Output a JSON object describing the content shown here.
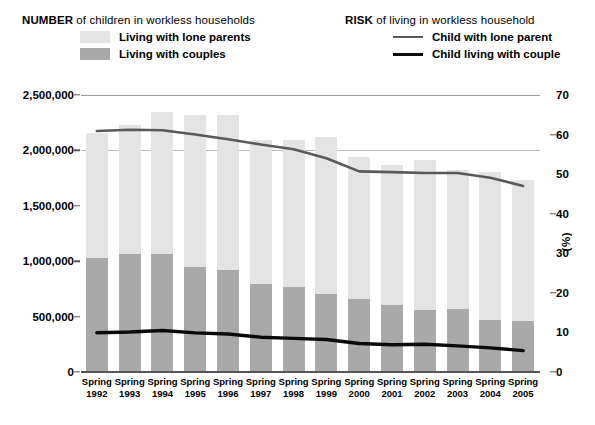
{
  "legend": {
    "number": {
      "title_strong": "NUMBER",
      "title_rest": " of children in workless households",
      "items": [
        {
          "label": "Living with lone parents",
          "color": "#e4e4e4",
          "swatch": "bar-swatch-lone-parents"
        },
        {
          "label": "Living with couples",
          "color": "#a9a9a9",
          "swatch": "bar-swatch-couples"
        }
      ]
    },
    "risk": {
      "title_strong": "RISK",
      "title_rest": " of living in workless household",
      "items": [
        {
          "label": "Child with lone parent",
          "color": "#595959",
          "width": "2.6px"
        },
        {
          "label": "Child living with couple",
          "color": "#0a0a0a",
          "width": "3.4px"
        }
      ]
    }
  },
  "axes": {
    "left": {
      "ticks": [
        "2,500,000",
        "2,000,000",
        "1,500,000",
        "1,000,000",
        "500,000",
        "0"
      ],
      "min": 0,
      "max": 2500000
    },
    "right": {
      "title": "(%)",
      "ticks": [
        "70",
        "60",
        "50",
        "40",
        "30",
        "20",
        "10",
        "0"
      ],
      "min": 0,
      "max": 70
    },
    "x": {
      "labels": [
        {
          "top": "Spring",
          "bottom": "1992"
        },
        {
          "top": "Spring",
          "bottom": "1993"
        },
        {
          "top": "Spring",
          "bottom": "1994"
        },
        {
          "top": "Spring",
          "bottom": "1995"
        },
        {
          "top": "Spring",
          "bottom": "1996"
        },
        {
          "top": "Spring",
          "bottom": "1997"
        },
        {
          "top": "Spring",
          "bottom": "1998"
        },
        {
          "top": "Spring",
          "bottom": "1999"
        },
        {
          "top": "Spring",
          "bottom": "2000"
        },
        {
          "top": "Spring",
          "bottom": "2001"
        },
        {
          "top": "Spring",
          "bottom": "2002"
        },
        {
          "top": "Spring",
          "bottom": "2003"
        },
        {
          "top": "Spring",
          "bottom": "2004"
        },
        {
          "top": "Spring",
          "bottom": "2005"
        }
      ]
    }
  },
  "chart_data": {
    "type": "bar",
    "categories": [
      "Spring 1992",
      "Spring 1993",
      "Spring 1994",
      "Spring 1995",
      "Spring 1996",
      "Spring 1997",
      "Spring 1998",
      "Spring 1999",
      "Spring 2000",
      "Spring 2001",
      "Spring 2002",
      "Spring 2003",
      "Spring 2004",
      "Spring 2005"
    ],
    "xlabel": "",
    "ylabel": "Number of children",
    "ylabel_right": "(%)",
    "ylim": [
      0,
      2500000
    ],
    "ylim_right": [
      0,
      70
    ],
    "grid": true,
    "legend_position": "top",
    "stacked": true,
    "series": [
      {
        "name": "Living with couples",
        "kind": "bar-segment",
        "axis": "left",
        "color": "#a9a9a9",
        "values": [
          1030000,
          1065000,
          1065000,
          948000,
          920000,
          790000,
          767000,
          705000,
          660000,
          605000,
          560000,
          570000,
          470000,
          460000
        ]
      },
      {
        "name": "Living with lone parents",
        "kind": "bar-segment",
        "axis": "left",
        "color": "#e4e4e4",
        "values": [
          1127000,
          1165000,
          1282000,
          1372000,
          1400000,
          1305000,
          1330000,
          1415000,
          1280000,
          1265000,
          1354000,
          1253000,
          1335000,
          1273000
        ]
      },
      {
        "name": "Total children in workless households",
        "kind": "bar-total",
        "axis": "left",
        "values": [
          2157000,
          2230000,
          2347000,
          2320000,
          2320000,
          2095000,
          2097000,
          2120000,
          1940000,
          1870000,
          1914000,
          1823000,
          1805000,
          1733000
        ]
      },
      {
        "name": "Child with lone parent",
        "kind": "line",
        "axis": "right",
        "color": "#595959",
        "values": [
          60.9,
          61.2,
          61.1,
          60.0,
          58.8,
          57.5,
          56.3,
          54.0,
          50.7,
          50.5,
          50.3,
          50.3,
          49.1,
          47.0
        ]
      },
      {
        "name": "Child living with couple",
        "kind": "line",
        "axis": "right",
        "color": "#0a0a0a",
        "values": [
          9.9,
          10.1,
          10.5,
          9.9,
          9.6,
          8.8,
          8.5,
          8.2,
          7.2,
          6.9,
          7.0,
          6.6,
          6.1,
          5.4
        ]
      }
    ]
  }
}
